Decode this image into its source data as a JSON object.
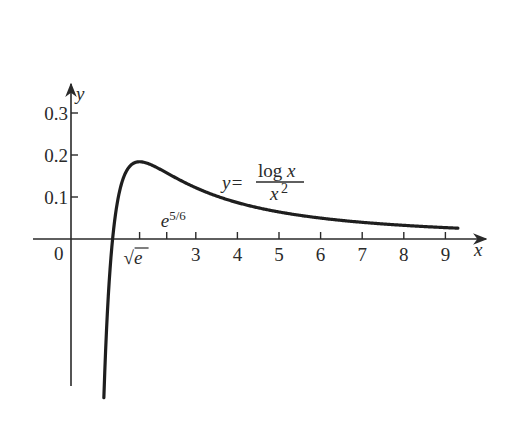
{
  "chart_data": {
    "type": "line",
    "title": "",
    "function_label": {
      "lhs": "y=",
      "numerator": "log x",
      "denominator": "x",
      "denominator_exp": "2"
    },
    "xlabel": "x",
    "ylabel": "y",
    "origin_label": "0",
    "x_ticks": [
      {
        "value": 1.6487,
        "label": "√e",
        "special": true
      },
      {
        "value": 2.301,
        "label": "e",
        "label_exp": "5/6",
        "special": true,
        "above": true
      },
      {
        "value": 3,
        "label": "3"
      },
      {
        "value": 4,
        "label": "4"
      },
      {
        "value": 5,
        "label": "5"
      },
      {
        "value": 6,
        "label": "6"
      },
      {
        "value": 7,
        "label": "7"
      },
      {
        "value": 8,
        "label": "8"
      },
      {
        "value": 9,
        "label": "9"
      }
    ],
    "y_ticks": [
      {
        "value": 0.1,
        "label": "0.1"
      },
      {
        "value": 0.2,
        "label": "0.2"
      },
      {
        "value": 0.3,
        "label": "0.3"
      }
    ],
    "xlim": [
      -0.9,
      9.9
    ],
    "ylim": [
      -0.35,
      0.33
    ],
    "grid": false,
    "series": [
      {
        "name": "y = log x / x^2",
        "x": [
          0.79,
          0.85,
          0.9,
          1.0,
          1.1,
          1.2,
          1.35,
          1.5,
          1.6487,
          1.8,
          2.0,
          2.3,
          2.6,
          3.0,
          3.5,
          4.0,
          5.0,
          6.0,
          7.0,
          8.0,
          9.0,
          9.3
        ],
        "y": [
          -0.377,
          -0.225,
          -0.13,
          0.0,
          0.079,
          0.127,
          0.165,
          0.18,
          0.184,
          0.181,
          0.173,
          0.157,
          0.141,
          0.122,
          0.102,
          0.087,
          0.064,
          0.05,
          0.04,
          0.032,
          0.027,
          0.026
        ]
      }
    ]
  }
}
